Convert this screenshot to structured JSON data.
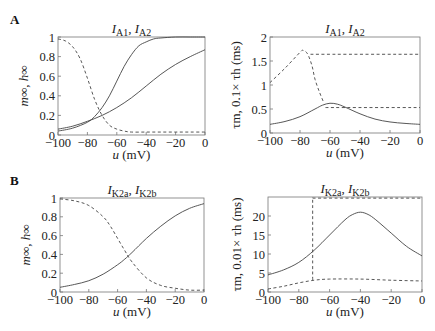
{
  "panels": [
    {
      "label": "A"
    },
    {
      "label": "B"
    }
  ],
  "chart_data": [
    {
      "id": "A-left",
      "type": "line",
      "panel": "A",
      "title": "I_A1, I_A2",
      "title_parts": {
        "main1": "I",
        "sub1": "A1",
        "sep": ", ",
        "main2": "I",
        "sub2": "A2"
      },
      "xlabel": "u (mV)",
      "ylabel": "m∞, h∞",
      "xlim": [
        -100,
        0
      ],
      "ylim": [
        0,
        1
      ],
      "xticks": [
        -100,
        -80,
        -60,
        -40,
        -20,
        0
      ],
      "yticks": [
        0,
        0.2,
        0.4,
        0.6,
        0.8,
        1
      ],
      "ytick_labels": [
        "0",
        "0.2",
        "0.4",
        "0.6",
        "0.8",
        "1"
      ],
      "grid": false,
      "frame_px": {
        "left": 58,
        "top": 37,
        "right": 205,
        "bottom": 135
      },
      "series": [
        {
          "name": "m_inf A1",
          "style": "solid",
          "x": [
            -100,
            -90,
            -80,
            -75,
            -70,
            -65,
            -60,
            -55,
            -50,
            -45,
            -40,
            -35,
            -30,
            -20,
            -10,
            0
          ],
          "y": [
            0.04,
            0.07,
            0.13,
            0.19,
            0.28,
            0.4,
            0.55,
            0.7,
            0.82,
            0.91,
            0.95,
            0.98,
            0.99,
            1.0,
            1.0,
            1.0
          ]
        },
        {
          "name": "m_inf A2",
          "style": "solid",
          "x": [
            -100,
            -90,
            -80,
            -70,
            -60,
            -50,
            -40,
            -30,
            -20,
            -10,
            0
          ],
          "y": [
            0.06,
            0.09,
            0.14,
            0.2,
            0.28,
            0.38,
            0.5,
            0.62,
            0.72,
            0.8,
            0.87
          ]
        },
        {
          "name": "h_inf",
          "style": "dashed",
          "x": [
            -100,
            -95,
            -90,
            -85,
            -80,
            -75,
            -70,
            -65,
            -60,
            -55,
            -50,
            -40,
            -30,
            -20,
            -10,
            0
          ],
          "y": [
            0.98,
            0.96,
            0.9,
            0.78,
            0.58,
            0.36,
            0.2,
            0.1,
            0.06,
            0.04,
            0.03,
            0.03,
            0.03,
            0.03,
            0.03,
            0.03
          ]
        }
      ]
    },
    {
      "id": "A-right",
      "type": "line",
      "panel": "A",
      "title": "I_A1, I_A2",
      "title_parts": {
        "main1": "I",
        "sub1": "A1",
        "sep": ", ",
        "main2": "I",
        "sub2": "A2"
      },
      "xlabel": "u (mV)",
      "ylabel": "τm, 0.1× τh (ms)",
      "xlim": [
        -100,
        0
      ],
      "ylim": [
        0,
        2
      ],
      "xticks": [
        -100,
        -80,
        -60,
        -40,
        -20,
        0
      ],
      "yticks": [
        0,
        0.5,
        1,
        1.5,
        2
      ],
      "ytick_labels": [
        "0",
        "0.5",
        "1",
        "1.5",
        "2"
      ],
      "grid": false,
      "frame_px": {
        "left": 270,
        "top": 37,
        "right": 420,
        "bottom": 133
      },
      "series": [
        {
          "name": "tau_m",
          "style": "solid",
          "x": [
            -100,
            -90,
            -80,
            -70,
            -65,
            -60,
            -55,
            -50,
            -40,
            -30,
            -20,
            -10,
            0
          ],
          "y": [
            0.18,
            0.24,
            0.34,
            0.5,
            0.58,
            0.62,
            0.6,
            0.54,
            0.4,
            0.29,
            0.23,
            0.2,
            0.18
          ]
        },
        {
          "name": "0.1 tau_h (A1)",
          "style": "dashed",
          "x": [
            -100,
            -90,
            -80,
            -78,
            -75,
            -72,
            -70,
            -67,
            -64
          ],
          "y": [
            1.05,
            1.35,
            1.68,
            1.72,
            1.65,
            1.4,
            1.12,
            0.85,
            0.62
          ]
        },
        {
          "name": "0.1 tau_h plateau high",
          "style": "dashed",
          "x": [
            -73,
            0
          ],
          "y": [
            1.64,
            1.64
          ]
        },
        {
          "name": "0.1 tau_h plateau low",
          "style": "dashed",
          "x": [
            -63,
            0
          ],
          "y": [
            0.53,
            0.53
          ]
        }
      ]
    },
    {
      "id": "B-left",
      "type": "line",
      "panel": "B",
      "title": "I_K2a, I_K2b",
      "title_parts": {
        "main1": "I",
        "sub1": "K2a",
        "sep": ", ",
        "main2": "I",
        "sub2": "K2b"
      },
      "xlabel": "u (mV)",
      "ylabel": "m∞, h∞",
      "xlim": [
        -100,
        0
      ],
      "ylim": [
        0,
        1
      ],
      "xticks": [
        -100,
        -80,
        -60,
        -40,
        -20,
        0
      ],
      "yticks": [
        0,
        0.2,
        0.4,
        0.6,
        0.8,
        1
      ],
      "ytick_labels": [
        "0",
        "0.2",
        "0.4",
        "0.6",
        "0.8",
        "1"
      ],
      "grid": false,
      "frame_px": {
        "left": 60,
        "top": 198,
        "right": 204,
        "bottom": 292
      },
      "series": [
        {
          "name": "m_inf",
          "style": "solid",
          "x": [
            -100,
            -90,
            -80,
            -70,
            -60,
            -55,
            -50,
            -40,
            -30,
            -20,
            -10,
            0
          ],
          "y": [
            0.05,
            0.08,
            0.12,
            0.19,
            0.29,
            0.35,
            0.42,
            0.57,
            0.7,
            0.81,
            0.89,
            0.94
          ]
        },
        {
          "name": "h_inf",
          "style": "dashed",
          "x": [
            -100,
            -90,
            -80,
            -70,
            -65,
            -60,
            -55,
            -50,
            -40,
            -30,
            -20,
            -10,
            0
          ],
          "y": [
            0.99,
            0.97,
            0.92,
            0.8,
            0.7,
            0.57,
            0.44,
            0.32,
            0.15,
            0.07,
            0.04,
            0.02,
            0.02
          ]
        }
      ]
    },
    {
      "id": "B-right",
      "type": "line",
      "panel": "B",
      "title": "I_K2a, I_K2b",
      "title_parts": {
        "main1": "I",
        "sub1": "K2a",
        "sep": ", ",
        "main2": "I",
        "sub2": "K2b"
      },
      "xlabel": "u (mV)",
      "ylabel": "τm, 0.01× τh (ms)",
      "xlim": [
        -100,
        0
      ],
      "ylim": [
        0,
        25
      ],
      "xticks": [
        -100,
        -80,
        -60,
        -40,
        -20,
        0
      ],
      "yticks": [
        0,
        5,
        10,
        15,
        20
      ],
      "ytick_labels": [
        "0",
        "5",
        "10",
        "15",
        "20"
      ],
      "grid": false,
      "frame_px": {
        "left": 268,
        "top": 197,
        "right": 422,
        "bottom": 292
      },
      "series": [
        {
          "name": "tau_m",
          "style": "solid",
          "x": [
            -100,
            -90,
            -80,
            -70,
            -60,
            -50,
            -45,
            -40,
            -35,
            -30,
            -20,
            -10,
            0
          ],
          "y": [
            4.5,
            5.8,
            7.8,
            11.0,
            15.0,
            19.0,
            20.4,
            21.0,
            20.4,
            19.0,
            15.5,
            12.0,
            9.5
          ]
        },
        {
          "name": "0.01 tau_h (K2a)",
          "style": "dashed",
          "x": [
            -100,
            -90,
            -80,
            -70,
            -60,
            -40,
            -20,
            0
          ],
          "y": [
            0.8,
            1.5,
            2.4,
            3.1,
            3.4,
            3.4,
            3.1,
            2.9
          ]
        },
        {
          "name": "0.01 tau_h (K2b) vertical",
          "style": "dashed",
          "x": [
            -71,
            -71
          ],
          "y": [
            3.2,
            25
          ]
        },
        {
          "name": "0.01 tau_h (K2b) plateau",
          "style": "dashed",
          "x": [
            -71,
            0
          ],
          "y": [
            24.7,
            24.7
          ]
        }
      ]
    }
  ]
}
